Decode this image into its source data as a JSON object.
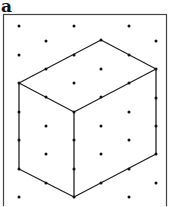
{
  "panel_label": "a",
  "figure": {
    "type": "isometric dot grid with cuboid",
    "frame": {
      "x": 3,
      "y": 14,
      "w": 164,
      "h": 200
    },
    "dots": [
      [
        19,
        26
      ],
      [
        74,
        26
      ],
      [
        129,
        26
      ],
      [
        46,
        41
      ],
      [
        156,
        41
      ],
      [
        19,
        55
      ],
      [
        101,
        69
      ],
      [
        74,
        83
      ],
      [
        46,
        126
      ],
      [
        101,
        126
      ],
      [
        46,
        154
      ],
      [
        101,
        154
      ],
      [
        129,
        112
      ],
      [
        129,
        140
      ],
      [
        156,
        183
      ],
      [
        19,
        197
      ],
      [
        129,
        197
      ]
    ],
    "edge_dots": [
      [
        101,
        40
      ],
      [
        74,
        55
      ],
      [
        46,
        69
      ],
      [
        19,
        83
      ],
      [
        129,
        55
      ],
      [
        156,
        69
      ],
      [
        46,
        97
      ],
      [
        74,
        112
      ],
      [
        101,
        97
      ],
      [
        129,
        83
      ],
      [
        156,
        98
      ],
      [
        19,
        112
      ],
      [
        19,
        140
      ],
      [
        19,
        169
      ],
      [
        74,
        140
      ],
      [
        74,
        169
      ],
      [
        74,
        197
      ],
      [
        46,
        183
      ],
      [
        101,
        183
      ],
      [
        129,
        169
      ],
      [
        156,
        126
      ],
      [
        156,
        154
      ]
    ],
    "edges": [
      [
        [
          101,
          40
        ],
        [
          156,
          69
        ]
      ],
      [
        [
          101,
          40
        ],
        [
          19,
          83
        ]
      ],
      [
        [
          19,
          83
        ],
        [
          74,
          112
        ]
      ],
      [
        [
          74,
          112
        ],
        [
          156,
          69
        ]
      ],
      [
        [
          19,
          83
        ],
        [
          19,
          169
        ]
      ],
      [
        [
          74,
          112
        ],
        [
          74,
          197
        ]
      ],
      [
        [
          156,
          69
        ],
        [
          156,
          154
        ]
      ],
      [
        [
          19,
          169
        ],
        [
          74,
          197
        ]
      ],
      [
        [
          74,
          197
        ],
        [
          156,
          154
        ]
      ]
    ],
    "line_color": "#222222",
    "dot_color": "#111111"
  }
}
